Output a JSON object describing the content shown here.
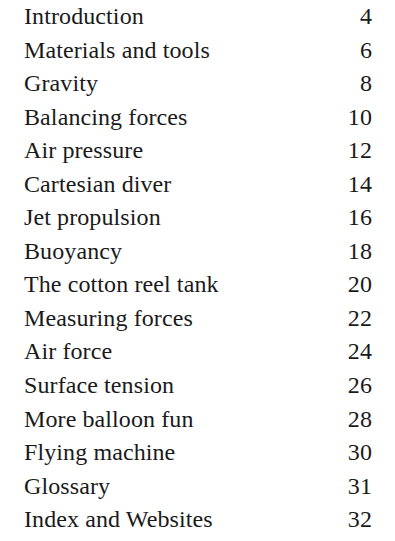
{
  "document": {
    "type": "table-of-contents",
    "text_color": "#1a1a1a",
    "background_color": "#ffffff",
    "entries": [
      {
        "title": "Introduction",
        "page": "4"
      },
      {
        "title": "Materials and tools",
        "page": "6"
      },
      {
        "title": "Gravity",
        "page": "8"
      },
      {
        "title": "Balancing forces",
        "page": "10"
      },
      {
        "title": "Air pressure",
        "page": "12"
      },
      {
        "title": "Cartesian diver",
        "page": "14"
      },
      {
        "title": "Jet propulsion",
        "page": "16"
      },
      {
        "title": "Buoyancy",
        "page": "18"
      },
      {
        "title": "The cotton reel tank",
        "page": "20"
      },
      {
        "title": "Measuring forces",
        "page": "22"
      },
      {
        "title": "Air force",
        "page": "24"
      },
      {
        "title": "Surface tension",
        "page": "26"
      },
      {
        "title": "More balloon fun",
        "page": "28"
      },
      {
        "title": "Flying machine",
        "page": "30"
      },
      {
        "title": "Glossary",
        "page": "31"
      },
      {
        "title": "Index and Websites",
        "page": "32"
      }
    ]
  }
}
